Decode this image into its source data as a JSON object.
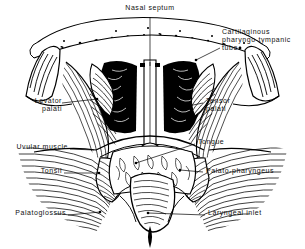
{
  "figure": {
    "title": "Nasal septum",
    "style": "black-and-white anatomical line engraving of the pharynx viewed from behind",
    "background_color": "#ffffff",
    "ink_color": "#000000"
  },
  "labels": [
    {
      "id": "nasal-septum",
      "text": "Nasal septum",
      "side": "center",
      "x": 150,
      "y": 6,
      "leader": {
        "x1": 150,
        "y1": 17,
        "x2": 150,
        "y2": 66
      }
    },
    {
      "id": "cartilaginous-tube",
      "text": "Cartilaginous\npharyngo-tympanic\ntube",
      "side": "right",
      "x": 222,
      "y": 30,
      "leader": {
        "x1": 220,
        "y1": 48,
        "x2": 196,
        "y2": 60
      }
    },
    {
      "id": "levator-palati",
      "text": "Levator\npalati",
      "side": "left",
      "x": 16,
      "y": 99,
      "leader": {
        "x1": 62,
        "y1": 103,
        "x2": 97,
        "y2": 99
      }
    },
    {
      "id": "tensor-palati",
      "text": "Tensor\npalati",
      "side": "right",
      "x": 205,
      "y": 99,
      "leader": {
        "x1": 203,
        "y1": 103,
        "x2": 178,
        "y2": 108
      }
    },
    {
      "id": "uvular-muscle",
      "text": "Uvular muscle",
      "side": "left",
      "x": 10,
      "y": 145,
      "leader": {
        "x1": 70,
        "y1": 149,
        "x2": 94,
        "y2": 150
      }
    },
    {
      "id": "tongue",
      "text": "Tongue",
      "side": "right",
      "x": 197,
      "y": 139,
      "leader": {
        "x1": 195,
        "y1": 144,
        "x2": 136,
        "y2": 163
      }
    },
    {
      "id": "tonsil",
      "text": "Tonsil",
      "side": "left",
      "x": 30,
      "y": 169,
      "leader": {
        "x1": 64,
        "y1": 173,
        "x2": 99,
        "y2": 173
      }
    },
    {
      "id": "palato-pharyngeus",
      "text": "Palato-pharyngeus",
      "side": "right",
      "x": 205,
      "y": 168,
      "leader": {
        "x1": 203,
        "y1": 172,
        "x2": 180,
        "y2": 170
      }
    },
    {
      "id": "palatoglossus",
      "text": "Palatoglossus",
      "side": "left",
      "x": 11,
      "y": 211,
      "leader": {
        "x1": 68,
        "y1": 215,
        "x2": 100,
        "y2": 212
      }
    },
    {
      "id": "laryngeal-inlet",
      "text": "Laryngeal inlet",
      "side": "right",
      "x": 207,
      "y": 211,
      "leader": {
        "x1": 205,
        "y1": 215,
        "x2": 148,
        "y2": 213
      }
    }
  ],
  "structures": [
    {
      "id": "skull-base-band",
      "name": "stippled skull base / nasal roof band"
    },
    {
      "id": "nasal-cavity-left",
      "name": "left dark nasal cavity (choana)"
    },
    {
      "id": "nasal-cavity-right",
      "name": "right dark nasal cavity (choana)"
    },
    {
      "id": "septum-column",
      "name": "central nasal septum column"
    },
    {
      "id": "tubal-elevation-left",
      "name": "left cartilaginous tube elevation"
    },
    {
      "id": "tubal-elevation-right",
      "name": "right cartilaginous tube elevation"
    },
    {
      "id": "levator-sling",
      "name": "levator palati muscle fan"
    },
    {
      "id": "tensor-sling",
      "name": "tensor palati muscle fan"
    },
    {
      "id": "soft-palate",
      "name": "soft palate arch"
    },
    {
      "id": "tonsil-left",
      "name": "left palatine tonsil"
    },
    {
      "id": "tonsil-right",
      "name": "right palatine tonsil"
    },
    {
      "id": "tongue-base",
      "name": "posterior tongue surface"
    },
    {
      "id": "epiglottis",
      "name": "epiglottis / laryngeal inlet"
    },
    {
      "id": "pharyngeal-wall",
      "name": "hatched pharyngeal wall fibres"
    }
  ]
}
